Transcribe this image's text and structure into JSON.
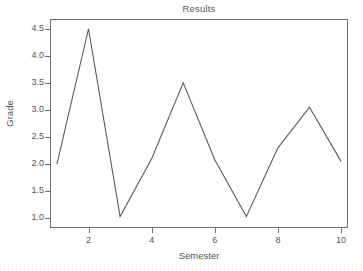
{
  "chart_data": {
    "type": "line",
    "title": "Results",
    "xlabel": "Semester",
    "ylabel": "Grade",
    "x": [
      1,
      2,
      3,
      4,
      5,
      6,
      7,
      8,
      9,
      10
    ],
    "values": [
      2.0,
      4.5,
      1.03,
      2.1,
      3.5,
      2.08,
      1.03,
      2.3,
      3.05,
      2.05
    ],
    "series": [
      {
        "name": "Grade",
        "values": [
          2.0,
          4.5,
          1.03,
          2.1,
          3.5,
          2.08,
          1.03,
          2.3,
          3.05,
          2.05
        ]
      }
    ],
    "xlim": [
      0.78,
      10.22
    ],
    "ylim": [
      0.82,
      4.68
    ],
    "x_ticks": [
      2,
      4,
      6,
      8,
      10
    ],
    "x_tick_labels": [
      "2",
      "4",
      "6",
      "8",
      "10"
    ],
    "y_ticks": [
      1.0,
      1.5,
      2.0,
      2.5,
      3.0,
      3.5,
      4.0,
      4.5
    ],
    "y_tick_labels": [
      "1.0",
      "1.5",
      "2.0",
      "2.5",
      "3.0",
      "3.5",
      "4.0",
      "4.5"
    ],
    "grid": false,
    "legend": "none",
    "line_color": "#5a5a5a",
    "line_width": 1.1,
    "markers": "none",
    "frame_color": "#6e6e6e",
    "background": "#ffffff",
    "text_color": "#555555"
  }
}
